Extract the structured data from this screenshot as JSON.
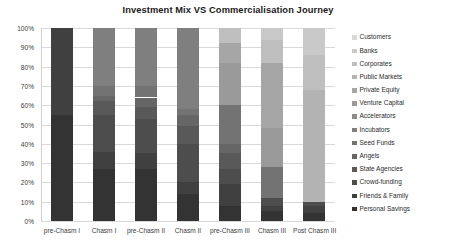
{
  "chart_data": {
    "type": "bar",
    "title": "Investment Mix VS Commercialisation Journey",
    "subtitle": "",
    "xlabel": "",
    "ylabel": "",
    "stacked": true,
    "stack_mode": "percent",
    "grid": true,
    "legend_position": "right",
    "ylim": [
      0,
      100
    ],
    "ytick_labels": [
      "100%",
      "90%",
      "80%",
      "70%",
      "60%",
      "50%",
      "40%",
      "30%",
      "20%",
      "10%",
      "0%"
    ],
    "ytick_values": [
      100,
      90,
      80,
      70,
      60,
      50,
      40,
      30,
      20,
      10,
      0
    ],
    "categories": [
      "pre-Chasm I",
      "Chasm I",
      "pre-Chasm II",
      "Chasm II",
      "pre-Chasm III",
      "Chasm III",
      "Post Chasm III"
    ],
    "series": [
      {
        "name": "Customers",
        "color": "#d9d9d9",
        "values": [
          0,
          0,
          0,
          0,
          0,
          0,
          0
        ]
      },
      {
        "name": "Banks",
        "color": "#c9c9c9",
        "values": [
          0,
          0,
          0,
          0,
          0,
          6,
          14
        ]
      },
      {
        "name": "Corporates",
        "color": "#bfbfbf",
        "values": [
          0,
          0,
          0,
          0,
          8,
          12,
          18
        ]
      },
      {
        "name": "Public Markets",
        "color": "#b3b3b3",
        "values": [
          0,
          0,
          0,
          0,
          0,
          0,
          58
        ]
      },
      {
        "name": "Private Equity",
        "color": "#a6a6a6",
        "values": [
          0,
          0,
          0,
          0,
          10,
          34,
          0
        ]
      },
      {
        "name": "Venture Capital",
        "color": "#9a9a9a",
        "values": [
          0,
          0,
          0,
          0,
          22,
          20,
          0
        ]
      },
      {
        "name": "Accelerators",
        "color": "#8c8c8c",
        "values": [
          0,
          0,
          0,
          0,
          0,
          0,
          0
        ]
      },
      {
        "name": "Incubators",
        "color": "#7f7f7f",
        "values": [
          0,
          30,
          30,
          42,
          0,
          0,
          0
        ]
      },
      {
        "name": "Seed Funds",
        "color": "#737373",
        "values": [
          0,
          5,
          6,
          3,
          20,
          16,
          0
        ]
      },
      {
        "name": "Angels",
        "color": "#666666",
        "values": [
          0,
          3,
          5,
          6,
          5,
          0,
          0
        ]
      },
      {
        "name": "State Agencies",
        "color": "#595959",
        "values": [
          0,
          7,
          6,
          9,
          8,
          0,
          0
        ]
      },
      {
        "name": "Crowd-funding",
        "color": "#4d4d4d",
        "values": [
          0,
          19,
          18,
          20,
          8,
          4,
          2
        ]
      },
      {
        "name": "Friends & Family",
        "color": "#404040",
        "values": [
          45,
          9,
          8,
          6,
          11,
          3,
          4
        ]
      },
      {
        "name": "Personal Savings",
        "color": "#333333",
        "values": [
          55,
          27,
          27,
          14,
          8,
          5,
          4
        ]
      }
    ]
  },
  "legend": {
    "items": [
      {
        "label": "Customers",
        "color": "#d9d9d9"
      },
      {
        "label": "Banks",
        "color": "#c9c9c9"
      },
      {
        "label": "Corporates",
        "color": "#bfbfbf"
      },
      {
        "label": "Public Markets",
        "color": "#b3b3b3"
      },
      {
        "label": "Private Equity",
        "color": "#a6a6a6"
      },
      {
        "label": "Venture Capital",
        "color": "#9a9a9a"
      },
      {
        "label": "Accelerators",
        "color": "#8c8c8c"
      },
      {
        "label": "Incubators",
        "color": "#7f7f7f"
      },
      {
        "label": "Seed Funds",
        "color": "#737373"
      },
      {
        "label": "Angels",
        "color": "#666666"
      },
      {
        "label": "State Agencies",
        "color": "#595959"
      },
      {
        "label": "Crowd-funding",
        "color": "#4d4d4d"
      },
      {
        "label": "Friends & Family",
        "color": "#404040"
      },
      {
        "label": "Personal Savings",
        "color": "#333333"
      }
    ]
  }
}
